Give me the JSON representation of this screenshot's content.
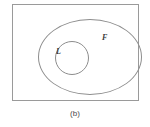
{
  "figure": {
    "caption": "(b)",
    "universe": {
      "name": "universe-rectangle",
      "label": "",
      "border_color": "#9a9a9a"
    },
    "sets": [
      {
        "id": "F",
        "label": "F",
        "shape": "ellipse",
        "border_color": "#8d8d8d"
      },
      {
        "id": "L",
        "label": "L",
        "shape": "circle",
        "border_color": "#8d8d8d"
      }
    ]
  }
}
